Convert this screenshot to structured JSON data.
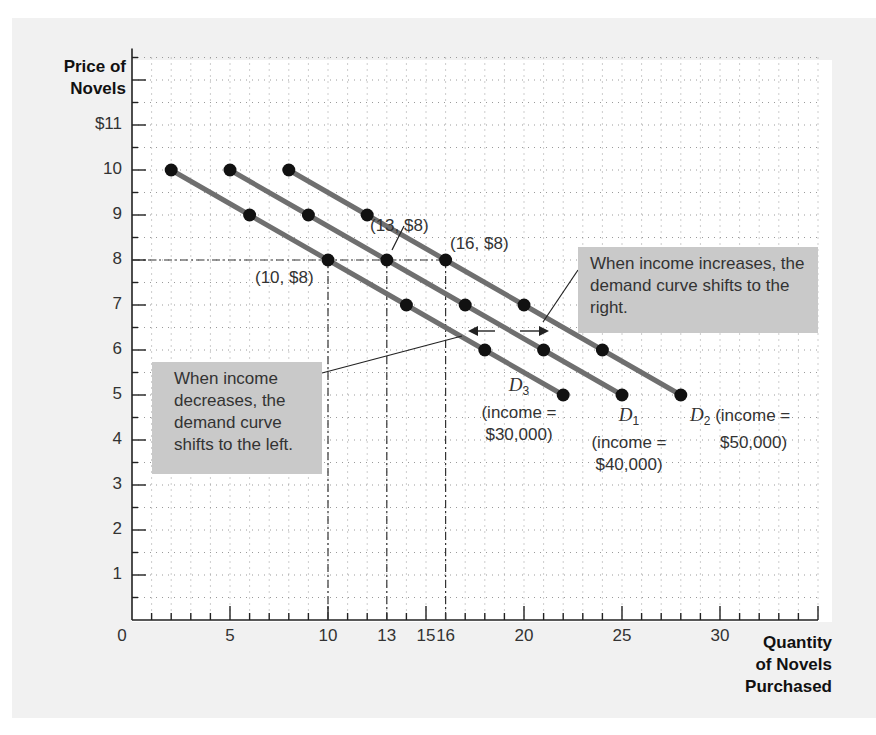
{
  "chart_data": {
    "type": "line",
    "title": "",
    "xlabel": "Quantity of Novels Purchased",
    "ylabel": "Price of Novels",
    "xlim": [
      0,
      35
    ],
    "ylim": [
      0,
      12
    ],
    "grid": true,
    "x_ticks": [
      "0",
      "5",
      "10",
      "13",
      "15",
      "16",
      "20",
      "25",
      "30"
    ],
    "y_ticks": [
      "1",
      "2",
      "3",
      "4",
      "5",
      "6",
      "7",
      "8",
      "9",
      "10",
      "$11"
    ],
    "series": [
      {
        "name": "D3 (income = $30,000)",
        "x": [
          2,
          6,
          10,
          14,
          18,
          22
        ],
        "y": [
          10,
          9,
          8,
          7,
          6,
          5
        ]
      },
      {
        "name": "D1 (income = $40,000)",
        "x": [
          5,
          9,
          13,
          17,
          21,
          25
        ],
        "y": [
          10,
          9,
          8,
          7,
          6,
          5
        ]
      },
      {
        "name": "D2 (income = $50,000)",
        "x": [
          8,
          12,
          16,
          20,
          24,
          28
        ],
        "y": [
          10,
          9,
          8,
          7,
          6,
          5
        ]
      }
    ],
    "annotations": [
      {
        "text": "(10, $8)",
        "x": 10,
        "y": 8
      },
      {
        "text": "(13, $8)",
        "x": 13,
        "y": 8
      },
      {
        "text": "(16, $8)",
        "x": 16,
        "y": 8
      },
      {
        "text": "When income increases, the demand curve shifts to the right."
      },
      {
        "text": "When income decreases, the demand curve shifts to the left."
      }
    ],
    "colors": {
      "line": "#6f6f6f",
      "point": "#111111",
      "note_bg": "#c9c9c9",
      "panel_bg": "#f1f1f1"
    }
  },
  "axes": {
    "y_title_line1": "Price of",
    "y_title_line2": "Novels",
    "x_title_line1": "Quantity",
    "x_title_line2": "of Novels",
    "x_title_line3": "Purchased"
  },
  "point_labels": {
    "p10": "(10, $8)",
    "p13": "(13, $8)",
    "p16": "(16, $8)"
  },
  "notes": {
    "increase": "When income increases, the demand curve shifts to the right.",
    "decrease": "When income decreases, the demand curve shifts to the left."
  },
  "curve_labels": {
    "d3_name": "D",
    "d3_sub": "3",
    "d3_line1": "(income =",
    "d3_line2": "$30,000)",
    "d1_name": "D",
    "d1_sub": "1",
    "d1_line1": "(income =",
    "d1_line2": "$40,000)",
    "d2_name": "D",
    "d2_sub": "2",
    "d2_line1": "(income =",
    "d2_line2": "$50,000)"
  }
}
